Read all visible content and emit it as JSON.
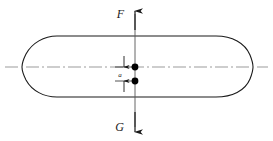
{
  "diagram": {
    "type": "engineering-free-body-diagram",
    "canvas": {
      "width": 273,
      "height": 141
    },
    "colors": {
      "background": "#ffffff",
      "outline": "#1a1a1a",
      "centerline": "#7a7a7a",
      "force_line": "#555555",
      "marker": "#000000",
      "text": "#1a1a1a"
    },
    "body": {
      "name": "hull-outline",
      "description": "Elongated capsule-like body with tapered rounded ends",
      "left_tip_x": 22,
      "right_tip_x": 251,
      "top_y": 36,
      "bottom_y": 97,
      "straight_left_x": 57,
      "straight_right_x": 216,
      "axis_y": 67
    },
    "centerline": {
      "name": "horizontal-centerline",
      "y": 67,
      "x_start": 5,
      "x_end": 268,
      "style": "dash-dot"
    },
    "force_axis": {
      "name": "vertical-force-axis",
      "x": 135,
      "y_top": 14,
      "y_bottom": 128
    },
    "forces": [
      {
        "id": "force-F",
        "label": "F",
        "direction": "up",
        "label_x": 124,
        "label_y": 16,
        "arrow_tip_y": 10,
        "description": "Upward buoyant force applied at the upper point marker"
      },
      {
        "id": "force-G",
        "label": "G",
        "direction": "down",
        "label_x": 124,
        "label_y": 130,
        "arrow_tip_y": 133,
        "description": "Downward gravitational force (weight) applied at the lower point marker"
      }
    ],
    "point_markers": [
      {
        "id": "upper-point-marker",
        "label": "",
        "x": 135,
        "y": 67,
        "radius": 3.4,
        "description": "Center of buoyancy located on the centerline"
      },
      {
        "id": "lower-point-marker",
        "label": "",
        "x": 135,
        "y": 81,
        "radius": 3.4,
        "description": "Center of gravity located below the centerline"
      }
    ],
    "dimension": {
      "id": "dimension-a",
      "label": "a",
      "label_x": 119,
      "label_y": 77,
      "line_x": 124,
      "upper_y": 67,
      "lower_y": 81,
      "extension_upper_y": 57,
      "extension_lower_y": 91,
      "description": "Vertical offset between the center of buoyancy and the center of gravity"
    }
  }
}
